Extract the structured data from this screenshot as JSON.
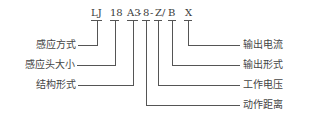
{
  "diagram": {
    "code_segments": [
      {
        "text": "LJ",
        "x": 91
      },
      {
        "text": "18",
        "x": 110
      },
      {
        "text": "A3",
        "x": 127
      },
      {
        "text": "-",
        "x": 138
      },
      {
        "text": "8",
        "x": 143
      },
      {
        "text": "-",
        "x": 150
      },
      {
        "text": "Z",
        "x": 155
      },
      {
        "text": "/",
        "x": 162
      },
      {
        "text": "B",
        "x": 168
      },
      {
        "text": "X",
        "x": 185
      }
    ],
    "left_labels": [
      {
        "text": "感应方式",
        "y": 45,
        "anchor_x": 97
      },
      {
        "text": "感应头大小",
        "y": 65,
        "anchor_x": 115
      },
      {
        "text": "结构形式",
        "y": 85,
        "anchor_x": 133
      }
    ],
    "right_labels": [
      {
        "text": "输出电流",
        "y": 45,
        "anchor_x": 188
      },
      {
        "text": "输出形式",
        "y": 65,
        "anchor_x": 172
      },
      {
        "text": "工作电压",
        "y": 85,
        "anchor_x": 158
      },
      {
        "text": "动作距离",
        "y": 105,
        "anchor_x": 146
      }
    ],
    "line_color": "#555555"
  }
}
